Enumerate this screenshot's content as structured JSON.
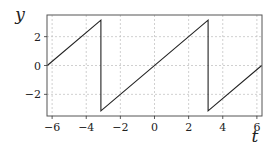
{
  "chart_data": {
    "type": "line",
    "title": "",
    "xlabel": "t",
    "ylabel": "y",
    "xlim": [
      -6.3,
      6.3
    ],
    "ylim": [
      -3.5,
      3.5
    ],
    "grid": true,
    "x_ticks": [
      -6,
      -4,
      -2,
      0,
      2,
      4,
      6
    ],
    "x_tick_labels": [
      "−6",
      "−4",
      "−2",
      "0",
      "2",
      "4",
      "6"
    ],
    "y_ticks": [
      -2,
      0,
      2
    ],
    "y_tick_labels": [
      "−2",
      "0",
      "2"
    ],
    "series": [
      {
        "name": "sawtooth (y = t wrapped to [−π, π))",
        "color": "#222222",
        "x": [
          -6.283,
          -3.1416,
          -3.1416,
          3.1416,
          3.1416,
          6.283
        ],
        "values": [
          0,
          3.1416,
          -3.1416,
          3.1416,
          -3.1416,
          0
        ]
      }
    ]
  }
}
